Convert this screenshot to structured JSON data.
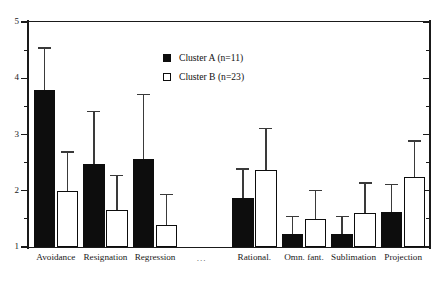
{
  "chart_data": {
    "type": "bar",
    "title": "",
    "subtitle": "",
    "xlabel": "",
    "ylabel": "",
    "ylim": [
      1,
      5
    ],
    "yticks": [
      1,
      2,
      3,
      4,
      5
    ],
    "ytick_labels": [
      "1",
      "2",
      "3",
      "4",
      "5"
    ],
    "yminor_ticks": [
      1.5,
      2.5,
      3.5,
      4.5
    ],
    "grid": false,
    "legend_position": "upper-center",
    "categories": [
      "Avoidance",
      "Resignation",
      "Regression",
      "...",
      "Rational.",
      "Omn. fant.",
      "Sublimation",
      "Projection"
    ],
    "gap_after_index": 2,
    "gap_label": "...",
    "series": [
      {
        "name": "Cluster A (n=11)",
        "short_name": "Cluster A",
        "n": 11,
        "color": "#0d0d0d",
        "fill": "solid",
        "values": [
          3.8,
          2.48,
          2.56,
          null,
          1.87,
          1.23,
          1.23,
          1.62
        ],
        "error_upper": [
          4.55,
          3.42,
          3.72,
          null,
          2.4,
          1.55,
          1.55,
          2.12
        ]
      },
      {
        "name": "Cluster B (n=23)",
        "short_name": "Cluster B",
        "n": 23,
        "color": "#ffffff",
        "fill": "open",
        "values": [
          2.0,
          1.66,
          1.4,
          null,
          2.37,
          1.5,
          1.6,
          2.25
        ],
        "error_upper": [
          2.7,
          2.28,
          1.95,
          null,
          3.12,
          2.02,
          2.15,
          2.9
        ]
      }
    ]
  },
  "legend": {
    "entries": [
      {
        "label": "Cluster A (n=11)",
        "swatch": "filled-square-icon"
      },
      {
        "label": "Cluster B (n=23)",
        "swatch": "open-square-icon"
      }
    ]
  },
  "axis": {
    "y_labels": [
      "1",
      "2",
      "3",
      "4",
      "5"
    ],
    "x_labels": [
      "Avoidance",
      "Resignation",
      "Regression",
      "...",
      "Rational.",
      "Omn. fant.",
      "Sublimation",
      "Projection"
    ]
  }
}
